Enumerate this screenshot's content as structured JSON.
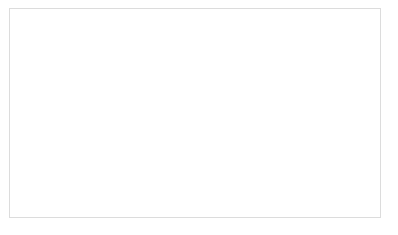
{
  "chart_data": {
    "type": "line",
    "title": "",
    "xlabel": "",
    "ylabel": "Preço da ação (R$)",
    "y2label": "Preço da opção (R$)",
    "grid": false,
    "legend_position": "right",
    "ylim": [
      18,
      30
    ],
    "y2lim": [
      0.0,
      9.0
    ],
    "yticks": [
      "18",
      "20",
      "22",
      "24",
      "26",
      "28",
      "30"
    ],
    "y2ticks": [
      "0,00",
      "1,00",
      "2,00",
      "3,00",
      "4,00",
      "5,00",
      "6,00",
      "7,00",
      "8,00",
      "9,00"
    ],
    "xticks": [
      "18/11/2010",
      "07/01/2011",
      "26/02/2011",
      "17/04/2011",
      "06/06/2011",
      "26/07/2011",
      "14/09/2011",
      "03/11/2011",
      "23/12/2011",
      "11/02/2012"
    ],
    "strike_line": {
      "label": "21,00",
      "stock_value": 20.3,
      "option_value": 1.7
    },
    "shaded_band": {
      "from": 18.0,
      "to": 20.35,
      "color": "#cccccc"
    },
    "series": [
      {
        "name": "Petrobras",
        "axis": "left",
        "style": "solid",
        "color": "#000000",
        "x_start": "07/01/2011",
        "values": [
          26.6,
          27.0,
          26.8,
          27.2,
          26.9,
          27.4,
          27.1,
          27.8,
          27.3,
          26.9,
          27.3,
          26.6,
          26.9,
          26.4,
          26.8,
          27.3,
          26.9,
          27.4,
          27.0,
          26.6,
          26.2,
          25.8,
          26.5,
          26.9,
          26.4,
          26.8,
          27.2,
          26.9,
          27.4,
          27.9,
          27.5,
          28.0,
          27.7,
          28.2,
          27.9,
          28.4,
          28.1,
          28.6,
          28.3,
          28.8,
          29.1,
          28.7,
          28.3,
          28.0,
          28.4,
          28.1,
          28.5,
          28.2,
          28.6,
          28.3,
          28.0,
          28.4,
          28.1,
          27.6,
          27.2,
          26.8,
          26.4,
          26.0,
          26.4,
          26.0,
          25.6,
          25.2,
          25.5,
          25.1,
          24.7,
          24.3,
          24.6,
          24.2,
          23.9,
          24.2,
          23.8,
          23.9,
          23.7,
          23.9,
          23.6,
          23.8,
          24.0,
          23.7,
          23.4,
          23.1,
          23.4,
          23.1,
          23.4,
          23.6,
          23.3,
          23.6,
          23.3,
          23.0,
          23.3,
          23.6,
          23.3,
          23.0,
          22.7,
          23.0,
          23.3,
          23.6,
          23.3,
          23.0,
          22.7,
          22.4,
          22.1,
          22.4,
          22.7,
          23.0,
          23.3,
          23.5,
          23.2,
          22.9,
          20.8,
          20.6,
          20.3,
          20.0,
          19.6,
          19.1,
          18.6,
          19.2,
          19.8,
          20.2,
          20.6,
          20.3,
          20.0,
          20.4,
          20.8,
          20.5,
          20.2,
          20.6,
          20.9,
          20.6,
          20.3,
          20.0,
          20.4,
          20.7,
          20.4,
          20.1,
          19.8,
          20.2,
          20.6,
          20.3,
          20.6,
          20.4,
          20.1,
          19.8,
          19.4,
          19.0,
          18.7,
          18.4,
          18.6,
          18.9,
          19.3,
          19.0,
          19.4,
          19.8,
          20.2,
          20.6,
          21.0,
          21.5,
          22.0,
          22.6,
          22.3,
          22.0,
          22.6,
          22.2,
          21.9,
          22.3,
          22.7,
          22.4,
          22.1,
          22.5,
          22.9,
          22.6,
          22.9,
          23.3,
          23.0,
          22.7,
          22.4,
          22.1,
          21.8,
          22.1,
          22.4,
          22.1,
          21.8,
          21.5,
          21.9,
          22.2,
          21.9,
          21.6,
          21.3,
          21.6,
          21.4
        ]
      },
      {
        "name": "Opção de 21,00",
        "axis": "right",
        "style": "dashed",
        "color": "#1a1a1a",
        "x_start": "17/04/2011",
        "values": [
          5.6,
          5.2,
          5.4,
          4.9,
          4.5,
          4.2,
          3.9,
          4.1,
          3.7,
          3.4,
          3.6,
          3.2,
          2.95,
          3.15,
          2.85,
          3.0,
          2.8,
          2.95,
          2.7,
          2.85,
          2.6,
          2.75,
          2.5,
          2.3,
          2.45,
          2.2,
          2.05,
          2.25,
          2.0,
          1.85,
          2.05,
          1.85,
          1.7,
          1.9,
          2.1,
          1.9,
          1.7,
          1.85,
          2.05,
          1.85,
          1.65,
          1.8,
          1.6,
          1.45,
          1.6,
          1.4,
          1.25,
          1.4,
          1.2,
          1.05,
          0.9,
          0.55,
          0.35,
          0.5,
          0.7,
          0.55,
          0.4,
          0.6,
          0.45,
          0.65,
          0.5,
          0.35,
          0.55,
          0.4,
          0.6,
          0.45,
          0.3,
          0.5,
          0.35,
          0.55,
          0.4,
          0.25,
          0.45,
          0.6,
          0.45,
          0.3,
          0.5,
          0.35,
          0.2,
          0.4,
          0.25,
          0.45,
          0.65,
          0.5,
          0.85,
          1.1,
          0.9,
          1.2,
          1.0,
          0.8,
          1.05,
          0.85,
          0.65,
          0.9,
          1.15,
          0.95,
          1.3,
          1.6,
          1.35,
          1.1,
          0.9,
          1.15,
          0.95,
          0.75,
          1.0,
          1.25,
          1.05,
          0.85,
          1.1,
          0.9,
          1.15,
          0.95,
          0.75,
          0.55,
          0.8,
          1.05,
          0.85,
          0.65,
          0.9,
          0.7,
          0.5,
          0.75,
          0.95,
          0.75
        ]
      }
    ]
  },
  "legend": {
    "items": [
      {
        "label": "Petrobras",
        "style": "solid"
      },
      {
        "label": "Opção de 21,00",
        "style": "dashed"
      }
    ]
  }
}
